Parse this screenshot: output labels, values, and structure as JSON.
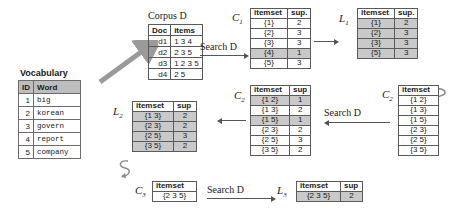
{
  "figure": {
    "title_vocabulary": "Vocabulary",
    "title_corpus": "Corpus D"
  },
  "vocabulary": {
    "name": "Vocabulary",
    "headers": [
      "ID",
      "Word"
    ],
    "rows": [
      {
        "id": "1",
        "word": "big"
      },
      {
        "id": "2",
        "word": "korean"
      },
      {
        "id": "3",
        "word": "govern"
      },
      {
        "id": "4",
        "word": "report"
      },
      {
        "id": "5",
        "word": "company"
      }
    ]
  },
  "corpus": {
    "name": "Corpus D",
    "headers": [
      "Doc",
      "items"
    ],
    "rows": [
      {
        "doc": "d1",
        "items": "1 3 4"
      },
      {
        "doc": "d2",
        "items": "2 3 5"
      },
      {
        "doc": "d3",
        "items": "1 2 3 5"
      },
      {
        "doc": "d4",
        "items": "2 5"
      }
    ]
  },
  "c1": {
    "label": "C",
    "sub": "1",
    "headers": [
      "itemset",
      "sup."
    ],
    "rows": [
      {
        "itemset": "{1}",
        "sup": "2",
        "shaded": false
      },
      {
        "itemset": "{2}",
        "sup": "3",
        "shaded": false
      },
      {
        "itemset": "{3}",
        "sup": "3",
        "shaded": false
      },
      {
        "itemset": "{4}",
        "sup": "1",
        "shaded": true
      },
      {
        "itemset": "{5}",
        "sup": "3",
        "shaded": false
      }
    ]
  },
  "l1": {
    "label": "L",
    "sub": "1",
    "headers": [
      "itemset",
      "sup."
    ],
    "rows": [
      {
        "itemset": "{1}",
        "sup": "2"
      },
      {
        "itemset": "{2}",
        "sup": "3"
      },
      {
        "itemset": "{3}",
        "sup": "3"
      },
      {
        "itemset": "{5}",
        "sup": "3"
      }
    ]
  },
  "c2_candidates": {
    "label": "C",
    "sub": "2",
    "headers": [
      "itemset"
    ],
    "rows": [
      {
        "itemset": "{1 2}"
      },
      {
        "itemset": "{1 3}"
      },
      {
        "itemset": "{1 5}"
      },
      {
        "itemset": "{2 3}"
      },
      {
        "itemset": "{2 5}"
      },
      {
        "itemset": "{3 5}"
      }
    ]
  },
  "c2_counted": {
    "label": "C",
    "sub": "2",
    "headers": [
      "itemset",
      "sup"
    ],
    "rows": [
      {
        "itemset": "{1 2}",
        "sup": "1",
        "shaded": true
      },
      {
        "itemset": "{1 3}",
        "sup": "2",
        "shaded": false
      },
      {
        "itemset": "{1 5}",
        "sup": "1",
        "shaded": true
      },
      {
        "itemset": "{2 3}",
        "sup": "2",
        "shaded": false
      },
      {
        "itemset": "{2 5}",
        "sup": "3",
        "shaded": false
      },
      {
        "itemset": "{3 5}",
        "sup": "2",
        "shaded": false
      }
    ]
  },
  "l2": {
    "label": "L",
    "sub": "2",
    "headers": [
      "itemset",
      "sup"
    ],
    "rows": [
      {
        "itemset": "{1 3}",
        "sup": "2"
      },
      {
        "itemset": "{2 3}",
        "sup": "2"
      },
      {
        "itemset": "{2 5}",
        "sup": "3"
      },
      {
        "itemset": "{3 5}",
        "sup": "2"
      }
    ]
  },
  "c3": {
    "label": "C",
    "sub": "3",
    "headers": [
      "itemset"
    ],
    "rows": [
      {
        "itemset": "{2 3 5}"
      }
    ]
  },
  "l3": {
    "label": "L",
    "sub": "3",
    "headers": [
      "itemset",
      "sup"
    ],
    "rows": [
      {
        "itemset": "{2 3 5}",
        "sup": "2"
      }
    ]
  },
  "annotations": {
    "search_d_1": "Search D",
    "search_d_2": "Search D",
    "search_d_3": "Search D"
  },
  "colors": {
    "shaded_row": "#c9c9c9",
    "header_gray": "#bdbdbd",
    "border": "#5a5a5a",
    "arrow": "#555555"
  }
}
